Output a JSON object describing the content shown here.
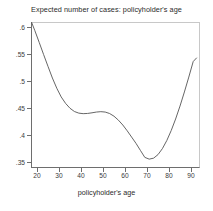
{
  "chart_data": {
    "type": "line",
    "title": "Expected number of cases: policyholder's age",
    "xlabel": "policyholder's age",
    "ylabel": "",
    "xlim": [
      17.5,
      92.5
    ],
    "ylim": [
      0.3537,
      0.609
    ],
    "xticks": [
      20,
      30,
      40,
      50,
      60,
      70,
      80,
      90
    ],
    "xtick_labels": [
      "20",
      "30",
      "40",
      "50",
      "60",
      "70",
      "80",
      "90"
    ],
    "yticks": [
      0.35,
      0.4,
      0.45,
      0.5,
      0.55,
      0.6
    ],
    "ytick_labels": [
      ".35",
      ".4",
      ".45",
      ".5",
      ".55",
      ".6"
    ],
    "grid": false,
    "legend": null,
    "line_color": "#555555",
    "series": [
      {
        "name": "Expected number of cases",
        "x": [
          17.5,
          19,
          21,
          23,
          25,
          27,
          29,
          31,
          33,
          35,
          37,
          39,
          41,
          43,
          45,
          47,
          49,
          51,
          53,
          55,
          57,
          59,
          61,
          63,
          65,
          67,
          69,
          71,
          73,
          75,
          77,
          79,
          81,
          83,
          85,
          87,
          89,
          91,
          92.5
        ],
        "y": [
          0.609,
          0.5935,
          0.5715,
          0.549,
          0.527,
          0.5055,
          0.4865,
          0.4705,
          0.4585,
          0.4495,
          0.4435,
          0.4405,
          0.4395,
          0.4399,
          0.4411,
          0.4425,
          0.4432,
          0.4425,
          0.4398,
          0.4348,
          0.4275,
          0.4185,
          0.4078,
          0.3962,
          0.3845,
          0.3715,
          0.3586,
          0.3553,
          0.3571,
          0.3637,
          0.3748,
          0.3898,
          0.4082,
          0.4296,
          0.4536,
          0.4797,
          0.5073,
          0.536,
          0.5426
        ]
      }
    ]
  }
}
